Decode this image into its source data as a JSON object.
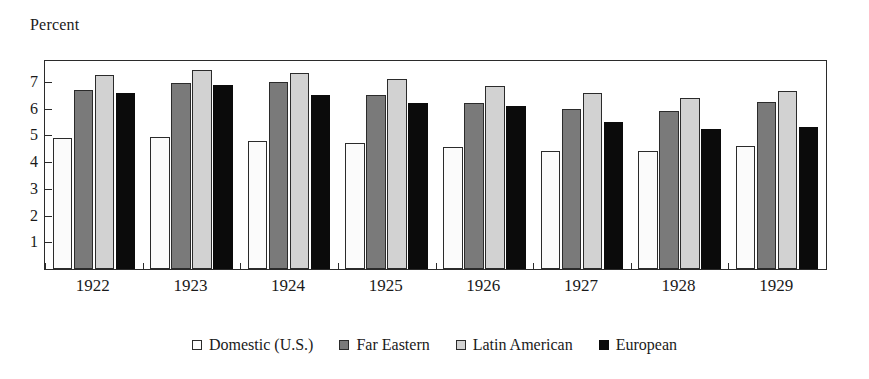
{
  "chart_data": {
    "type": "bar",
    "title": "Percent",
    "xlabel": "",
    "ylabel": "",
    "ylim": [
      0,
      7.78
    ],
    "yticks": [
      1,
      2,
      3,
      4,
      5,
      6,
      7
    ],
    "ytick_labels": [
      "1",
      "2",
      "3",
      "4",
      "5",
      "6",
      "7"
    ],
    "grid": false,
    "legend_position": "bottom-center",
    "categories": [
      "1922",
      "1923",
      "1924",
      "1925",
      "1926",
      "1927",
      "1928",
      "1929"
    ],
    "series": [
      {
        "name": "Domestic (U.S.)",
        "color": "#fbfbfb",
        "values": [
          4.9,
          4.95,
          4.8,
          4.7,
          4.55,
          4.4,
          4.4,
          4.6
        ]
      },
      {
        "name": "Far Eastern",
        "color": "#7a7a7a",
        "values": [
          6.7,
          6.95,
          7.0,
          6.5,
          6.2,
          6.0,
          5.9,
          6.25
        ]
      },
      {
        "name": "Latin American",
        "color": "#d2d2d2",
        "values": [
          7.25,
          7.45,
          7.35,
          7.1,
          6.85,
          6.6,
          6.4,
          6.65
        ]
      },
      {
        "name": "European",
        "color": "#0b0b0b",
        "values": [
          6.6,
          6.9,
          6.5,
          6.2,
          6.1,
          5.5,
          5.25,
          5.3
        ]
      }
    ]
  },
  "legend": {
    "items": [
      {
        "label": "Domestic (U.S.)",
        "swatch": "legend-swatch-domestic"
      },
      {
        "label": "Far Eastern",
        "swatch": "legend-swatch-far-eastern"
      },
      {
        "label": "Latin American",
        "swatch": "legend-swatch-latin-american"
      },
      {
        "label": "European",
        "swatch": "legend-swatch-european"
      }
    ]
  }
}
